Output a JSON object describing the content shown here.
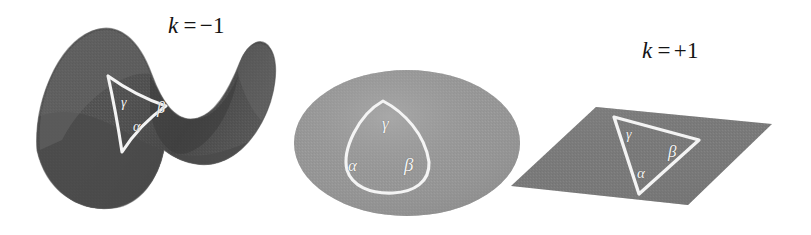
{
  "figure": {
    "background_color": "#ffffff",
    "width": 811,
    "height": 235
  },
  "panels": [
    {
      "id": "hyperbolic",
      "caption": {
        "variable": "k",
        "relation": "=",
        "value": "−1",
        "full": "k = −1"
      },
      "surface_name": "saddle-surface",
      "surface_color": "#555555",
      "surface_color_light": "#6e6e6e",
      "surface_color_dark": "#474747",
      "triangle": {
        "name": "hyperbolic-triangle",
        "side_curvature": "concave",
        "outline_color": "#f4f4f4",
        "angles": [
          {
            "symbol": "γ",
            "name": "gamma",
            "x": 121,
            "y": 96,
            "size": 14
          },
          {
            "symbol": "β",
            "name": "beta",
            "x": 157,
            "y": 100,
            "size": 16
          },
          {
            "symbol": "α",
            "name": "alpha",
            "x": 133,
            "y": 120,
            "size": 14
          }
        ]
      }
    },
    {
      "id": "spherical",
      "caption": {
        "variable": "k",
        "relation": "=",
        "value": "+1",
        "full": "k = +1"
      },
      "surface_name": "sphere-surface",
      "surface_color": "#979797",
      "surface_color_light": "#a6a6a6",
      "surface_color_dark": "#8b8b8b",
      "triangle": {
        "name": "spherical-triangle",
        "side_curvature": "convex",
        "outline_color": "#f4f4f4",
        "angles": [
          {
            "symbol": "γ",
            "name": "gamma",
            "x": 382,
            "y": 115,
            "size": 17
          },
          {
            "symbol": "α",
            "name": "alpha",
            "x": 348,
            "y": 157,
            "size": 17
          },
          {
            "symbol": "β",
            "name": "beta",
            "x": 404,
            "y": 155,
            "size": 19
          }
        ]
      }
    },
    {
      "id": "euclidean",
      "caption": {
        "variable": "k",
        "relation": "=",
        "value": "0",
        "full": "k = 0"
      },
      "surface_name": "plane-surface",
      "surface_color": "#7a7a7a",
      "surface_color_light": "#848484",
      "surface_color_dark": "#707070",
      "triangle": {
        "name": "euclidean-triangle",
        "side_curvature": "straight",
        "outline_color": "#f4f4f4",
        "angles": [
          {
            "symbol": "γ",
            "name": "gamma",
            "x": 626,
            "y": 128,
            "size": 14
          },
          {
            "symbol": "β",
            "name": "beta",
            "x": 668,
            "y": 143,
            "size": 17
          },
          {
            "symbol": "α",
            "name": "alpha",
            "x": 637,
            "y": 166,
            "size": 15
          }
        ]
      }
    }
  ]
}
